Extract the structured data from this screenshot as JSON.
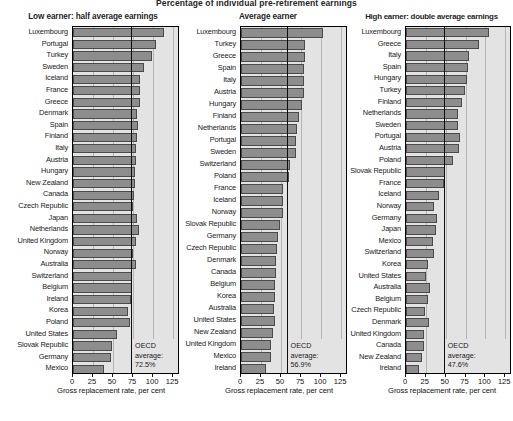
{
  "figure": {
    "super_title": "Percentage of individual pre-retirement earnings",
    "axis_title": "Gross replacement rate, per cent",
    "tick_labels": [
      "0",
      "25",
      "50",
      "75",
      "100",
      "125"
    ],
    "tick_values": [
      0,
      25,
      50,
      75,
      100,
      125
    ],
    "avg_label_line1": "OECD",
    "avg_label_line2": "average:",
    "bar_color": "#8d8d8d",
    "plot_bg_color": "#e3e3e3",
    "avg_line_color": "#0d0d0d"
  },
  "panels": [
    {
      "title": "Low earner: half average earnings",
      "oecd_average": 72.5,
      "oecd_average_text": "72.5%",
      "axis_title": "Gross replacement rate, per cent"
    },
    {
      "title": "Average earner",
      "oecd_average": 56.9,
      "oecd_average_text": "56.9%",
      "axis_title": "Gross replacement rate, per cent"
    },
    {
      "title": "High earner: double average earnings",
      "oecd_average": 47.6,
      "oecd_average_text": "47.6%",
      "axis_title": "Gross replacement rate, per cent"
    }
  ],
  "chart_data": [
    {
      "type": "bar",
      "title": "Low earner: half average earnings",
      "xlabel": "Gross replacement rate, per cent",
      "ylabel": "",
      "xlim": [
        0,
        131
      ],
      "orientation": "horizontal",
      "grid": true,
      "reference_line": {
        "label": "OECD average",
        "value": 72.5
      },
      "categories": [
        "Luxembourg",
        "Portugal",
        "Turkey",
        "Sweden",
        "Iceland",
        "France",
        "Greece",
        "Denmark",
        "Spain",
        "Finland",
        "Italy",
        "Austria",
        "Hungary",
        "New Zealand",
        "Canada",
        "Czech Republic",
        "Japan",
        "Netherlands",
        "United Kingdom",
        "Norway",
        "Australia",
        "Switzerland",
        "Belgium",
        "Ireland",
        "Korea",
        "Poland",
        "United States",
        "Slovak Republic",
        "Germany",
        "Mexico"
      ],
      "values": [
        113,
        104,
        99,
        88,
        84,
        84,
        84,
        80,
        81,
        80,
        79,
        79,
        77,
        77,
        76,
        75,
        80,
        82,
        78,
        75,
        78,
        73,
        73,
        72,
        68,
        71,
        55,
        49,
        48,
        39
      ]
    },
    {
      "type": "bar",
      "title": "Average earner",
      "xlabel": "Gross replacement rate, per cent",
      "ylabel": "",
      "xlim": [
        0,
        131
      ],
      "orientation": "horizontal",
      "grid": true,
      "reference_line": {
        "label": "OECD average",
        "value": 56.9
      },
      "categories": [
        "Luxembourg",
        "Turkey",
        "Greece",
        "Spain",
        "Italy",
        "Austria",
        "Hungary",
        "Finland",
        "Netherlands",
        "Portugal",
        "Sweden",
        "Switzerland",
        "Poland",
        "France",
        "Iceland",
        "Norway",
        "Slovak Republic",
        "Germany",
        "Czech Republic",
        "Denmark",
        "Canada",
        "Belgium",
        "Korea",
        "Australia",
        "United States",
        "New Zealand",
        "United Kingdom",
        "Mexico",
        "Ireland"
      ],
      "values": [
        102,
        80,
        80,
        78,
        78,
        78,
        76,
        72,
        70,
        68,
        68,
        61,
        60,
        52,
        52,
        52,
        49,
        46,
        45,
        44,
        44,
        42,
        42,
        41,
        42,
        40,
        38,
        37,
        31
      ]
    },
    {
      "type": "bar",
      "title": "High earner: double average earnings",
      "xlabel": "Gross replacement rate, per cent",
      "ylabel": "",
      "xlim": [
        0,
        131
      ],
      "orientation": "horizontal",
      "grid": true,
      "reference_line": {
        "label": "OECD average",
        "value": 47.6
      },
      "categories": [
        "Luxembourg",
        "Greece",
        "Italy",
        "Spain",
        "Hungary",
        "Turkey",
        "Finland",
        "Netherlands",
        "Sweden",
        "Portugal",
        "Austria",
        "Poland",
        "Slovak Republic",
        "France",
        "Iceland",
        "Norway",
        "Germany",
        "Japan",
        "Mexico",
        "Switzerland",
        "Korea",
        "United States",
        "Australia",
        "Belgium",
        "Czech Republic",
        "Denmark",
        "United Kingdom",
        "Canada",
        "New Zealand",
        "Ireland"
      ],
      "values": [
        104,
        92,
        79,
        78,
        77,
        74,
        71,
        66,
        66,
        68,
        67,
        59,
        49,
        48,
        42,
        35,
        39,
        38,
        34,
        35,
        28,
        25,
        30,
        28,
        24,
        29,
        23,
        23,
        20,
        16
      ]
    }
  ]
}
